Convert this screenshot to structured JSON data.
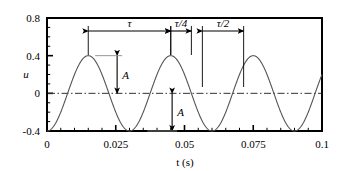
{
  "chart_data": {
    "type": "line",
    "title": "",
    "xlabel": "t (s)",
    "ylabel": "u",
    "xlim": [
      0,
      0.1
    ],
    "ylim": [
      -0.4,
      0.8
    ],
    "grid": false,
    "legend": null,
    "x_ticks": [
      "0",
      "0.025",
      "0.05",
      "0.075",
      "0.1"
    ],
    "x_tick_values": [
      0,
      0.025,
      0.05,
      0.075,
      0.1
    ],
    "y_ticks": [
      "0.8",
      "0.4",
      "0",
      "-0.4"
    ],
    "y_tick_values": [
      0.8,
      0.4,
      0,
      -0.4
    ],
    "x_minor_tick_count": 5,
    "y_minor_tick_count": 4,
    "series": [
      {
        "name": "u(t)",
        "equation": "u = -A*cos(2*pi*t/tau)",
        "amplitude": 0.4,
        "period": 0.03,
        "phase": "minimum at t=0",
        "color": "#555555",
        "samples_x": [
          0,
          0.0025,
          0.005,
          0.0075,
          0.01,
          0.0125,
          0.015,
          0.0175,
          0.02,
          0.0225,
          0.025,
          0.0275,
          0.03,
          0.0325,
          0.035,
          0.0375,
          0.04,
          0.0425,
          0.045,
          0.0475,
          0.05,
          0.0525,
          0.055,
          0.0575,
          0.06,
          0.0625,
          0.065,
          0.0675,
          0.07,
          0.0725,
          0.075,
          0.0775,
          0.08,
          0.0825,
          0.085,
          0.0875,
          0.09,
          0.0925,
          0.095,
          0.0975,
          0.1
        ],
        "samples_y": [
          -0.4,
          -0.346,
          -0.2,
          0.0,
          0.2,
          0.346,
          0.4,
          0.346,
          0.2,
          0.0,
          -0.2,
          -0.346,
          -0.4,
          -0.346,
          -0.2,
          0.0,
          0.2,
          0.346,
          0.4,
          0.346,
          0.2,
          0.0,
          -0.2,
          -0.346,
          -0.4,
          -0.346,
          -0.2,
          0.0,
          0.2,
          0.346,
          0.4,
          0.346,
          0.2,
          0.0,
          -0.2,
          -0.346,
          -0.4,
          -0.346,
          -0.2,
          0.0,
          0.2
        ]
      }
    ],
    "zero_line": {
      "value": 0,
      "style": "dash-dot",
      "color": "#333333"
    },
    "annotations": [
      {
        "id": "tau",
        "label": "τ",
        "kind": "double-arrow-horizontal",
        "from_t": 0.015,
        "to_t": 0.045,
        "meaning": "period"
      },
      {
        "id": "tau-over-4",
        "label": "τ/4",
        "kind": "double-arrow-horizontal",
        "from_t": 0.045,
        "to_t": 0.0525,
        "meaning": "quarter period"
      },
      {
        "id": "tau-over-2",
        "label": "τ/2",
        "kind": "double-arrow-horizontal",
        "from_t": 0.0565,
        "to_t": 0.0715,
        "meaning": "half period"
      },
      {
        "id": "amplitude-upper",
        "label": "A",
        "kind": "double-arrow-vertical",
        "at_t": 0.0255,
        "from_u": 0.4,
        "to_u": 0.0,
        "meaning": "amplitude above zero"
      },
      {
        "id": "amplitude-lower",
        "label": "A",
        "kind": "double-arrow-vertical",
        "at_t": 0.0455,
        "from_u": 0.0,
        "to_u": -0.4,
        "meaning": "amplitude below zero"
      }
    ],
    "colors": {
      "curve": "#555555",
      "axis": "#000000",
      "zero_line": "#333333",
      "annotation": "#000000",
      "background": "#ffffff"
    }
  }
}
